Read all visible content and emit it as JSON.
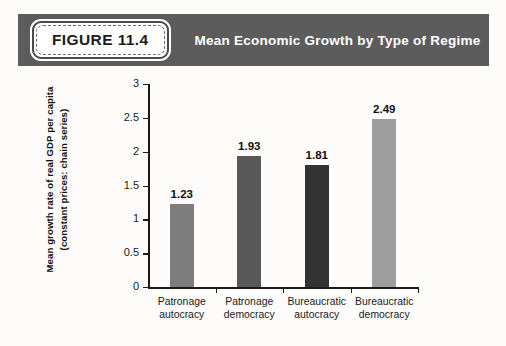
{
  "header": {
    "badge_label": "FIGURE 11.4",
    "title": "Mean Economic Growth by Type of Regime",
    "background_color": "#5c5c5c",
    "badge_background_color": "#ffffff",
    "title_color": "#ffffff"
  },
  "chart_data": {
    "type": "bar",
    "title": "Mean Economic Growth by Type of Regime",
    "subtitle": "",
    "categories": [
      "Patronage autocracy",
      "Patronage democracy",
      "Bureaucratic autocracy",
      "Bureaucratic democracy"
    ],
    "category_lines": [
      [
        "Patronage",
        "autocracy"
      ],
      [
        "Patronage",
        "democracy"
      ],
      [
        "Bureaucratic",
        "autocracy"
      ],
      [
        "Bureaucratic",
        "democracy"
      ]
    ],
    "values": [
      1.23,
      1.93,
      1.81,
      2.49
    ],
    "value_labels": [
      "1.23",
      "1.93",
      "1.81",
      "2.49"
    ],
    "bar_colors": [
      "#7d7d7d",
      "#585858",
      "#333333",
      "#9e9e9e"
    ],
    "xlabel": "",
    "ylabel": "Mean growth rate of real GDP per capita (constant prices: chain series)",
    "ylabel_lines": [
      "Mean growth rate of real GDP per capita",
      "(constant prices: chain series)"
    ],
    "ylim": [
      0,
      3
    ],
    "yticks": [
      0,
      0.5,
      1,
      1.5,
      2,
      2.5,
      3
    ],
    "ytick_labels": [
      "0",
      "0.5",
      "1",
      "1.5",
      "2",
      "2.5",
      "3"
    ],
    "grid": false,
    "legend": false,
    "legend_position": "none",
    "background_color": "#fdfcfa",
    "axis_color": "#1a1a1a"
  }
}
